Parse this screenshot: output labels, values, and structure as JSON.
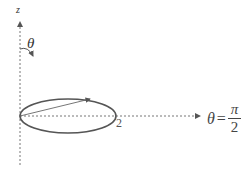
{
  "diagram": {
    "axis_z_label": "z",
    "theta_label": "θ",
    "radius_label": "2",
    "horizontal_label": {
      "lhs": "θ",
      "equals": "=",
      "numerator": "π",
      "denominator": "2"
    },
    "colors": {
      "ellipse": "#555555",
      "axis": "#777777",
      "arrow": "#555555"
    }
  }
}
